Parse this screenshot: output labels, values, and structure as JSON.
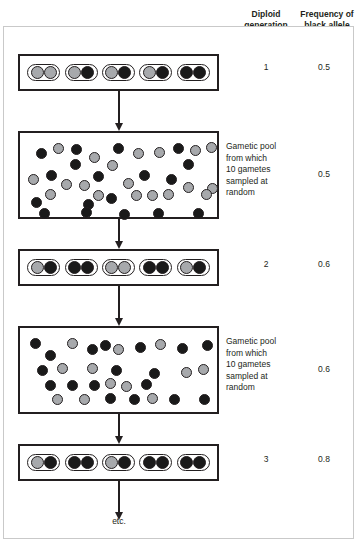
{
  "figure": {
    "columns": {
      "generation_header": "Diploid\ngeneration",
      "frequency_header": "Frequency of\nblack allele"
    },
    "footer_label": "etc.",
    "colors": {
      "black_allele": "#1a1a1a",
      "gray_allele": "#a7a9ac",
      "outline": "#231f20",
      "frame": "#c9c9c9"
    },
    "pool_note": "Gametic pool\nfrom which\n10 gametes\nsampled at\nrandom"
  },
  "chart_data": {
    "type": "diagram",
    "allele_legend": [
      {
        "name": "black allele",
        "color": "#1a1a1a"
      },
      {
        "name": "gray allele",
        "color": "#a7a9ac"
      }
    ],
    "generations": [
      {
        "generation": "1",
        "frequency_black": "0.5",
        "individuals": [
          [
            "gray",
            "gray"
          ],
          [
            "gray",
            "black"
          ],
          [
            "gray",
            "black"
          ],
          [
            "gray",
            "black"
          ],
          [
            "black",
            "black"
          ]
        ],
        "black_count": 5,
        "total_alleles": 10
      },
      {
        "generation": "2",
        "frequency_black": "0.6",
        "individuals": [
          [
            "gray",
            "black"
          ],
          [
            "black",
            "black"
          ],
          [
            "gray",
            "gray"
          ],
          [
            "black",
            "black"
          ],
          [
            "gray",
            "black"
          ]
        ],
        "black_count": 6,
        "total_alleles": 10
      },
      {
        "generation": "3",
        "frequency_black": "0.8",
        "individuals": [
          [
            "gray",
            "black"
          ],
          [
            "black",
            "black"
          ],
          [
            "gray",
            "black"
          ],
          [
            "black",
            "black"
          ],
          [
            "black",
            "black"
          ]
        ],
        "black_count": 8,
        "total_alleles": 10
      }
    ],
    "gametic_pools": [
      {
        "note": "Gametic pool\nfrom which\n10 gametes\nsampled at\nrandom",
        "frequency_black": "0.5",
        "gametes": [
          {
            "c": "black",
            "x": 13,
            "y": 11
          },
          {
            "c": "gray",
            "x": 30,
            "y": 6
          },
          {
            "c": "black",
            "x": 48,
            "y": 7
          },
          {
            "c": "black",
            "x": 47,
            "y": 22
          },
          {
            "c": "gray",
            "x": 66,
            "y": 15
          },
          {
            "c": "gray",
            "x": 84,
            "y": 23
          },
          {
            "c": "black",
            "x": 90,
            "y": 6
          },
          {
            "c": "gray",
            "x": 110,
            "y": 11
          },
          {
            "c": "gray",
            "x": 131,
            "y": 10
          },
          {
            "c": "black",
            "x": 150,
            "y": 6
          },
          {
            "c": "gray",
            "x": 167,
            "y": 8
          },
          {
            "c": "black",
            "x": 160,
            "y": 22
          },
          {
            "c": "gray",
            "x": 183,
            "y": 5
          },
          {
            "c": "gray",
            "x": 5,
            "y": 37
          },
          {
            "c": "black",
            "x": 23,
            "y": 33
          },
          {
            "c": "gray",
            "x": 38,
            "y": 42
          },
          {
            "c": "gray",
            "x": 56,
            "y": 43
          },
          {
            "c": "black",
            "x": 70,
            "y": 34
          },
          {
            "c": "gray",
            "x": 100,
            "y": 41
          },
          {
            "c": "black",
            "x": 116,
            "y": 33
          },
          {
            "c": "black",
            "x": 143,
            "y": 37
          },
          {
            "c": "gray",
            "x": 160,
            "y": 45
          },
          {
            "c": "gray",
            "x": 184,
            "y": 46
          },
          {
            "c": "black",
            "x": 8,
            "y": 60
          },
          {
            "c": "gray",
            "x": 22,
            "y": 52
          },
          {
            "c": "gray",
            "x": 70,
            "y": 53
          },
          {
            "c": "black",
            "x": 60,
            "y": 62
          },
          {
            "c": "black",
            "x": 83,
            "y": 56
          },
          {
            "c": "gray",
            "x": 108,
            "y": 53
          },
          {
            "c": "gray",
            "x": 124,
            "y": 53
          },
          {
            "c": "gray",
            "x": 140,
            "y": 52
          },
          {
            "c": "gray",
            "x": 178,
            "y": 52
          },
          {
            "c": "black",
            "x": 16,
            "y": 71
          },
          {
            "c": "black",
            "x": 58,
            "y": 70
          },
          {
            "c": "black",
            "x": 96,
            "y": 72
          },
          {
            "c": "black",
            "x": 130,
            "y": 71
          },
          {
            "c": "black",
            "x": 170,
            "y": 71
          }
        ]
      },
      {
        "note": "Gametic pool\nfrom which\n10 gametes\nsampled at\nrandom",
        "frequency_black": "0.6",
        "gametes": [
          {
            "c": "black",
            "x": 7,
            "y": 6
          },
          {
            "c": "gray",
            "x": 44,
            "y": 6
          },
          {
            "c": "black",
            "x": 64,
            "y": 12
          },
          {
            "c": "black",
            "x": 77,
            "y": 8
          },
          {
            "c": "gray",
            "x": 90,
            "y": 12
          },
          {
            "c": "black",
            "x": 112,
            "y": 10
          },
          {
            "c": "gray",
            "x": 132,
            "y": 7
          },
          {
            "c": "black",
            "x": 154,
            "y": 11
          },
          {
            "c": "black",
            "x": 179,
            "y": 8
          },
          {
            "c": "black",
            "x": 22,
            "y": 18
          },
          {
            "c": "gray",
            "x": 34,
            "y": 31
          },
          {
            "c": "gray",
            "x": 64,
            "y": 31
          },
          {
            "c": "black",
            "x": 88,
            "y": 33
          },
          {
            "c": "black",
            "x": 126,
            "y": 36
          },
          {
            "c": "gray",
            "x": 158,
            "y": 35
          },
          {
            "c": "gray",
            "x": 175,
            "y": 32
          },
          {
            "c": "black",
            "x": 14,
            "y": 33
          },
          {
            "c": "black",
            "x": 22,
            "y": 48
          },
          {
            "c": "black",
            "x": 44,
            "y": 48
          },
          {
            "c": "black",
            "x": 66,
            "y": 48
          },
          {
            "c": "gray",
            "x": 82,
            "y": 46
          },
          {
            "c": "gray",
            "x": 98,
            "y": 49
          },
          {
            "c": "black",
            "x": 118,
            "y": 47
          },
          {
            "c": "gray",
            "x": 29,
            "y": 62
          },
          {
            "c": "gray",
            "x": 56,
            "y": 62
          },
          {
            "c": "black",
            "x": 82,
            "y": 61
          },
          {
            "c": "black",
            "x": 106,
            "y": 62
          },
          {
            "c": "gray",
            "x": 124,
            "y": 61
          },
          {
            "c": "black",
            "x": 146,
            "y": 62
          },
          {
            "c": "black",
            "x": 176,
            "y": 62
          }
        ]
      }
    ]
  }
}
